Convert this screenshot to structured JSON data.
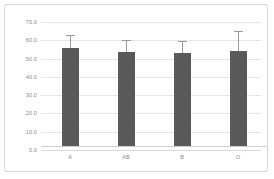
{
  "chart_data": {
    "type": "bar",
    "title": "",
    "subtitle": "",
    "xlabel": "",
    "ylabel": "",
    "categories": [
      "A",
      "AB",
      "B",
      "O"
    ],
    "values": [
      53.5,
      51.5,
      50.8,
      52.0
    ],
    "errors_upper": [
      60.0,
      57.5,
      57.0,
      62.5
    ],
    "error_bars": [
      6.5,
      6.0,
      6.2,
      10.5
    ],
    "ylim": [
      0.0,
      70.0
    ],
    "ytick_step": 10.0,
    "yticks": [
      "0.0",
      "10.0",
      "20.0",
      "30.0",
      "40.0",
      "50.0",
      "60.0",
      "70.0"
    ],
    "ytick_values": [
      0.0,
      10.0,
      20.0,
      30.0,
      40.0,
      50.0,
      60.0,
      70.0
    ],
    "grid": true,
    "legend": false,
    "legend_position": "none",
    "series": [
      {
        "name": "",
        "values": [
          53.5,
          51.5,
          50.8,
          52.0
        ]
      }
    ]
  },
  "style": {
    "bar_color": "#595959",
    "gridline_color": "#e6e6e6",
    "error_bar_color": "#9a9a9a",
    "axis_text_color": "#8a8a8a",
    "frame_border_color": "#d4d4d4",
    "background_color": "#ffffff"
  }
}
